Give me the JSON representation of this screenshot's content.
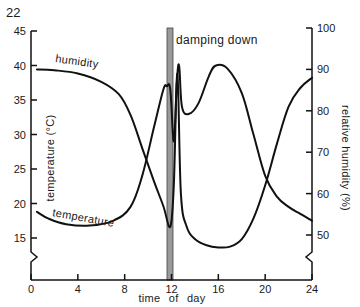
{
  "figure_number": "22",
  "chart_data": {
    "type": "line",
    "title": "",
    "xlabel": "time of day",
    "ylabel_left": "temperature (°C)",
    "ylabel_right": "relative humidity (%)",
    "x_ticks": [
      0,
      4,
      8,
      12,
      16,
      20,
      24
    ],
    "y_left_ticks": [
      15,
      20,
      25,
      30,
      35,
      40,
      45
    ],
    "y_right_ticks": [
      50,
      60,
      70,
      80,
      90,
      100
    ],
    "xlim": [
      0,
      24
    ],
    "ylim_left": [
      15,
      45
    ],
    "ylim_right": [
      50,
      100
    ],
    "grid": false,
    "annotation": {
      "label": "damping down",
      "x_start": 11.7,
      "x_end": 12.2
    },
    "series": [
      {
        "name": "temperature",
        "axis": "left",
        "x": [
          0.5,
          1.5,
          3,
          5,
          7,
          8.5,
          9.5,
          10.5,
          11.3,
          11.6,
          11.9,
          12.2,
          12.45,
          12.65,
          12.9,
          13.5,
          14.3,
          15.2,
          15.8,
          16.8,
          18,
          19,
          20,
          21,
          22,
          23,
          24
        ],
        "values": [
          18.8,
          17.8,
          17,
          16.8,
          17.5,
          19.5,
          24,
          31,
          36.5,
          37,
          36.5,
          29,
          37.5,
          40,
          34,
          33,
          34.5,
          38.5,
          40,
          39.5,
          36,
          30,
          24,
          21,
          19.5,
          18.5,
          17.5
        ]
      },
      {
        "name": "humidity",
        "axis": "right",
        "x": [
          0.5,
          2,
          4,
          6,
          7.5,
          8.5,
          9.5,
          10.5,
          11.3,
          11.9,
          12.2,
          12.5,
          12.8,
          13.3,
          14,
          15,
          16,
          17,
          18,
          19,
          20,
          21,
          22,
          23,
          24
        ],
        "values": [
          90,
          89.8,
          89,
          87,
          84,
          79,
          71,
          63,
          57,
          52,
          62,
          89,
          60,
          52,
          49,
          47.5,
          47,
          47.2,
          49,
          54,
          62,
          72,
          81,
          85.5,
          88
        ]
      }
    ]
  }
}
